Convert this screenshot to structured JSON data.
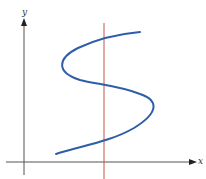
{
  "diagram": {
    "axes": {
      "x_label": "x",
      "y_label": "y",
      "color": "#555555"
    },
    "curve": {
      "description": "S-shaped curve that is not a function of x",
      "color": "#2f5ea8"
    },
    "vertical_line": {
      "description": "Vertical line intersecting the curve three times",
      "color": "#c8504a",
      "intersections": 3
    }
  }
}
